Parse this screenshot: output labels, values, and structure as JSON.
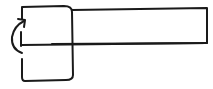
{
  "diagram": {
    "title": "",
    "elements": [
      {
        "id": "square-block",
        "kind": "rounded-square"
      },
      {
        "id": "long-bar",
        "kind": "rectangle"
      },
      {
        "id": "axis-line",
        "kind": "line"
      },
      {
        "id": "rotation-arrow",
        "kind": "curved-arrow",
        "direction": "counterclockwise-up"
      }
    ],
    "labels": [],
    "stroke_color": "#1a1a1a",
    "background_color": "#ffffff"
  }
}
